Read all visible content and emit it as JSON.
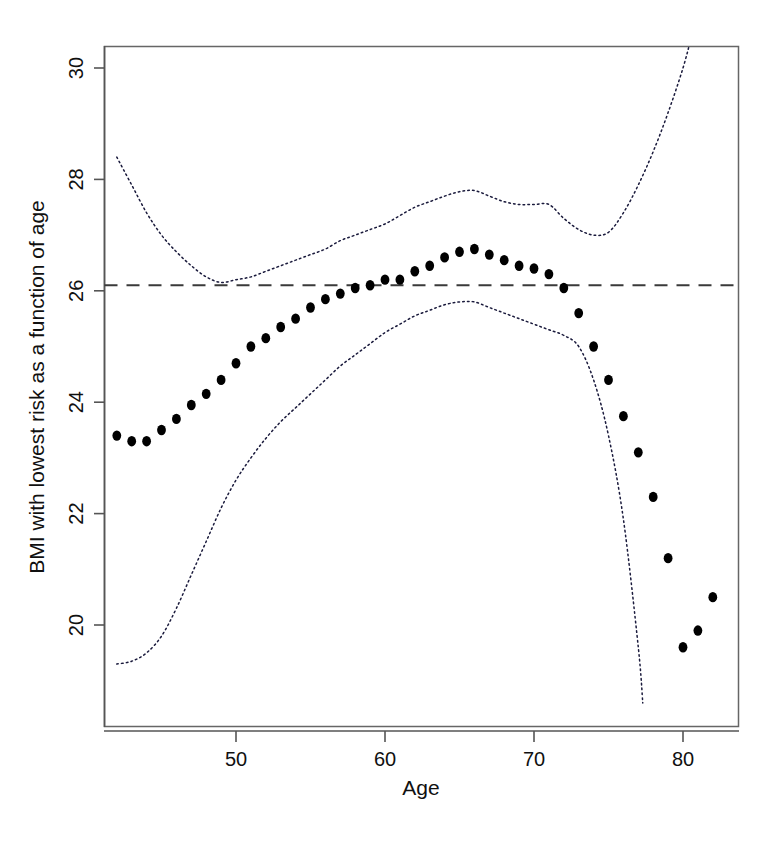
{
  "figure": {
    "background_color": "#ffffff",
    "point_color": "#000000",
    "ci_color": "#1a1a3c",
    "reference_line_color": "#3a3a3a"
  },
  "axes": {
    "x_title": "Age",
    "y_title": "BMI with lowest risk as a function of age",
    "x_ticks": [
      50,
      60,
      70,
      80
    ],
    "y_ticks": [
      20,
      22,
      24,
      26,
      28,
      30
    ],
    "x_tick_labels": [
      "50",
      "60",
      "70",
      "80"
    ],
    "y_tick_labels": [
      "20",
      "22",
      "24",
      "26",
      "28",
      "30"
    ]
  },
  "chart_data": {
    "type": "scatter",
    "title": "",
    "subtitle": "",
    "xlabel": "Age",
    "ylabel": "BMI with lowest risk as a function of age",
    "xlim": [
      41.4,
      83.2
    ],
    "ylim": [
      18.3,
      30.7
    ],
    "grid": false,
    "legend": null,
    "annotations": [],
    "reference_line": {
      "name": "overall lowest-risk BMI",
      "orientation": "horizontal",
      "y": 26.1,
      "style": "dashed"
    },
    "series": [
      {
        "name": "BMI with lowest risk",
        "type": "scatter",
        "marker": "filled-circle",
        "x": [
          42,
          43,
          44,
          45,
          46,
          47,
          48,
          49,
          50,
          51,
          52,
          53,
          54,
          55,
          56,
          57,
          58,
          59,
          60,
          61,
          62,
          63,
          64,
          65,
          66,
          67,
          68,
          69,
          70,
          71,
          72,
          73,
          74,
          75,
          76,
          77,
          78,
          79,
          80,
          81,
          82
        ],
        "values": [
          23.4,
          23.3,
          23.3,
          23.5,
          23.7,
          23.95,
          24.15,
          24.4,
          24.7,
          25.0,
          25.15,
          25.35,
          25.5,
          25.7,
          25.85,
          25.95,
          26.05,
          26.1,
          26.2,
          26.2,
          26.35,
          26.45,
          26.6,
          26.7,
          26.75,
          26.65,
          26.55,
          26.45,
          26.4,
          26.3,
          26.05,
          25.6,
          25.0,
          24.4,
          23.75,
          23.1,
          22.3,
          21.2,
          19.6,
          19.9,
          20.5
        ]
      },
      {
        "name": "upper 95% confidence limit",
        "type": "line",
        "style": "dotted",
        "x": [
          42,
          43,
          44,
          45,
          46,
          47,
          48,
          49,
          50,
          51,
          52,
          53,
          54,
          55,
          56,
          57,
          58,
          59,
          60,
          61,
          62,
          63,
          64,
          65,
          66,
          67,
          68,
          69,
          70,
          71,
          72,
          73,
          74,
          75,
          76,
          77,
          78,
          79,
          80,
          80.6
        ],
        "values": [
          28.4,
          27.9,
          27.4,
          27.0,
          26.7,
          26.45,
          26.25,
          26.15,
          26.2,
          26.25,
          26.35,
          26.45,
          26.55,
          26.65,
          26.75,
          26.9,
          27.0,
          27.1,
          27.2,
          27.35,
          27.5,
          27.6,
          27.7,
          27.78,
          27.8,
          27.7,
          27.6,
          27.55,
          27.55,
          27.55,
          27.3,
          27.1,
          27.0,
          27.05,
          27.4,
          27.9,
          28.5,
          29.2,
          30.0,
          30.6
        ]
      },
      {
        "name": "lower 95% confidence limit",
        "type": "line",
        "style": "dotted",
        "x": [
          42,
          43,
          44,
          45,
          46,
          47,
          48,
          49,
          50,
          51,
          52,
          53,
          54,
          55,
          56,
          57,
          58,
          59,
          60,
          61,
          62,
          63,
          64,
          65,
          66,
          67,
          68,
          69,
          70,
          71,
          72,
          73,
          74,
          75,
          76,
          77,
          77.3
        ],
        "values": [
          19.3,
          19.35,
          19.5,
          19.8,
          20.3,
          20.9,
          21.5,
          22.1,
          22.6,
          23.0,
          23.35,
          23.65,
          23.9,
          24.15,
          24.4,
          24.65,
          24.85,
          25.05,
          25.25,
          25.4,
          25.55,
          25.65,
          25.75,
          25.8,
          25.8,
          25.7,
          25.6,
          25.5,
          25.4,
          25.3,
          25.2,
          25.0,
          24.4,
          23.4,
          21.9,
          19.6,
          18.6
        ]
      }
    ]
  }
}
